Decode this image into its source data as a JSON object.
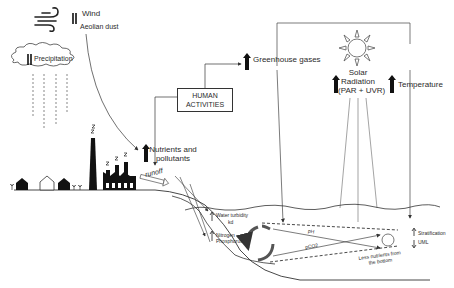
{
  "diagram": {
    "drivers": {
      "wind": {
        "label": "Wind",
        "sublabel": "Aeolian dust",
        "trend": "up-down"
      },
      "precipitation": {
        "label": "Precipitation",
        "trend": "up-down"
      },
      "human_activities": {
        "label_line1": "HUMAN",
        "label_line2": "ACTIVITIES"
      },
      "greenhouse_gases": {
        "label": "Greenhouse gases",
        "trend": "up"
      },
      "solar_radiation": {
        "label_line1": "Solar",
        "label_line2": "Radiation",
        "label_line3": "(PAR + UVR)",
        "trend": "up"
      },
      "temperature": {
        "label": "Temperature",
        "trend": "up"
      },
      "nutrients": {
        "label_line1": "Nutrients and",
        "label_line2": "pollutants",
        "trend": "up"
      },
      "runoff": {
        "label": "runoff"
      }
    },
    "lake": {
      "water_turbidity": {
        "label": "Water turbidity",
        "sublabel": "kd",
        "trend": "up"
      },
      "nitrogen_phosphorus": {
        "label_line1": "Nitrogen",
        "label_line2": "Phosphorus",
        "trend": "up"
      },
      "ph": {
        "label": "pH"
      },
      "pco2": {
        "label": "pCO2"
      },
      "stratification": {
        "label": "Stratification",
        "trend": "up"
      },
      "uml": {
        "label": "UML",
        "trend": "down"
      },
      "less_nutrients": {
        "label_line1": "Less nutrients from",
        "label_line2": "the bottom"
      }
    },
    "icons": [
      "wind-icon",
      "cloud-icon",
      "sun-icon",
      "factory-icon",
      "chimney-icon",
      "house-icon",
      "cycle-arrows-icon"
    ],
    "colors": {
      "ink": "#222222",
      "line": "#555555",
      "background": "#ffffff"
    }
  }
}
